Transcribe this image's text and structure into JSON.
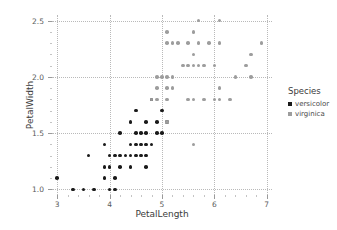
{
  "chart_data": {
    "type": "scatter",
    "title": "",
    "xlabel": "PetalLength",
    "ylabel": "PetalWidth",
    "xlim": [
      2.9,
      7.1
    ],
    "ylim": [
      0.95,
      2.55
    ],
    "xticks": [
      "3",
      "4",
      "5",
      "6",
      "7"
    ],
    "xtick_values": [
      3,
      4,
      5,
      6,
      7
    ],
    "yticks": [
      "1.0",
      "1.5",
      "2.0",
      "2.5"
    ],
    "ytick_values": [
      1.0,
      1.5,
      2.0,
      2.5
    ],
    "grid": true,
    "grid_style": "dotted",
    "legend_position": "right",
    "legend_title": "Species",
    "series": [
      {
        "name": "versicolor",
        "color": "#1a1a1a",
        "points": [
          [
            3.0,
            1.1
          ],
          [
            3.3,
            1.0
          ],
          [
            3.5,
            1.0
          ],
          [
            3.7,
            1.0
          ],
          [
            3.9,
            1.1
          ],
          [
            4.0,
            1.0
          ],
          [
            4.1,
            1.0
          ],
          [
            4.1,
            1.1
          ],
          [
            3.9,
            1.2
          ],
          [
            4.0,
            1.2
          ],
          [
            4.2,
            1.2
          ],
          [
            4.4,
            1.2
          ],
          [
            4.7,
            1.2
          ],
          [
            3.6,
            1.3
          ],
          [
            4.0,
            1.3
          ],
          [
            4.1,
            1.3
          ],
          [
            4.2,
            1.3
          ],
          [
            4.3,
            1.3
          ],
          [
            4.4,
            1.3
          ],
          [
            4.5,
            1.3
          ],
          [
            4.6,
            1.3
          ],
          [
            4.7,
            1.3
          ],
          [
            3.9,
            1.4
          ],
          [
            4.4,
            1.4
          ],
          [
            4.5,
            1.4
          ],
          [
            4.6,
            1.4
          ],
          [
            4.7,
            1.4
          ],
          [
            4.8,
            1.4
          ],
          [
            4.2,
            1.5
          ],
          [
            4.5,
            1.5
          ],
          [
            4.6,
            1.5
          ],
          [
            4.7,
            1.5
          ],
          [
            4.9,
            1.5
          ],
          [
            5.0,
            1.5
          ],
          [
            4.4,
            1.6
          ],
          [
            4.7,
            1.6
          ],
          [
            4.9,
            1.6
          ],
          [
            5.1,
            1.6
          ],
          [
            4.5,
            1.7
          ],
          [
            5.0,
            1.7
          ],
          [
            4.8,
            1.8
          ]
        ]
      },
      {
        "name": "virginica",
        "color": "#9d9d9d",
        "points": [
          [
            5.6,
            1.4
          ],
          [
            5.1,
            1.6
          ],
          [
            4.9,
            1.8
          ],
          [
            5.1,
            1.8
          ],
          [
            5.5,
            1.8
          ],
          [
            5.6,
            1.8
          ],
          [
            5.8,
            1.8
          ],
          [
            6.0,
            1.8
          ],
          [
            6.1,
            1.8
          ],
          [
            6.3,
            1.8
          ],
          [
            4.8,
            1.8
          ],
          [
            4.9,
            1.9
          ],
          [
            5.1,
            1.9
          ],
          [
            5.2,
            1.9
          ],
          [
            6.1,
            1.9
          ],
          [
            4.9,
            2.0
          ],
          [
            5.0,
            2.0
          ],
          [
            5.1,
            2.0
          ],
          [
            5.2,
            2.0
          ],
          [
            6.4,
            2.0
          ],
          [
            6.7,
            2.0
          ],
          [
            5.4,
            2.1
          ],
          [
            5.5,
            2.1
          ],
          [
            5.6,
            2.1
          ],
          [
            5.7,
            2.1
          ],
          [
            5.8,
            2.1
          ],
          [
            6.0,
            2.1
          ],
          [
            6.6,
            2.1
          ],
          [
            5.6,
            2.2
          ],
          [
            6.7,
            2.2
          ],
          [
            5.1,
            2.3
          ],
          [
            5.2,
            2.3
          ],
          [
            5.3,
            2.3
          ],
          [
            5.5,
            2.3
          ],
          [
            5.7,
            2.3
          ],
          [
            5.9,
            2.3
          ],
          [
            6.1,
            2.3
          ],
          [
            6.9,
            2.3
          ],
          [
            5.1,
            2.4
          ],
          [
            5.6,
            2.4
          ],
          [
            5.7,
            2.5
          ],
          [
            6.1,
            2.5
          ]
        ]
      }
    ]
  },
  "legend": {
    "title": "Species",
    "entries": [
      {
        "label": "versicolor",
        "color": "#1a1a1a"
      },
      {
        "label": "virginica",
        "color": "#9d9d9d"
      }
    ]
  }
}
